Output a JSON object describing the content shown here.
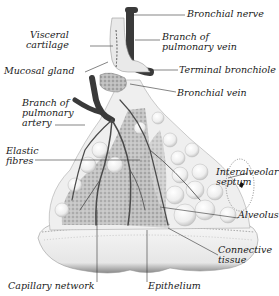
{
  "diagram": {
    "labels": {
      "bronchial_nerve": "Bronchial nerve",
      "visceral_cartilage": "Visceral\ncartilage",
      "branch_pulmonary_vein": "Branch of\npulmonary vein",
      "mucosal_gland": "Mucosal gland",
      "terminal_bronchiole": "Terminal bronchiole",
      "bronchial_vein": "Bronchial vein",
      "branch_pulmonary_artery": "Branch of\npulmonary\nartery",
      "elastic_fibres": "Elastic\nfibres",
      "interalveolar_septum": "Interalveolar\nseptum",
      "alveolus": "Alveolus",
      "connective_tissue": "Connective\ntissue",
      "capillary_network": "Capillary network",
      "epithelium": "Epithelium"
    },
    "colors": {
      "vessel": "#3a3a3a",
      "alveoli": "#f2f2f2",
      "capillary_texture": "#9a9a9a",
      "leader_line": "#333333",
      "text": "#1a1a1a"
    }
  }
}
